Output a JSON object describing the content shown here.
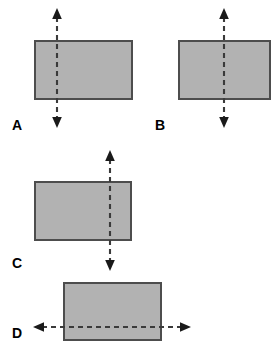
{
  "figure": {
    "kind": "physics-diagram",
    "background_color": "#ffffff",
    "block_fill_color": "#b2b2b2",
    "block_border_color": "#4d4d4d",
    "axis_color": "#3a3a3a",
    "arrowhead_color": "#1a1a1a",
    "label_color": "#000000"
  },
  "panels": [
    {
      "id": "A",
      "label": "A",
      "label_x": 12,
      "label_y": 118,
      "rect": {
        "x": 34,
        "y": 40,
        "w": 99,
        "h": 60
      },
      "axis": {
        "orientation": "vertical",
        "position_px": 57,
        "position_fraction": 0.23,
        "from": 10,
        "to": 126,
        "arrowheads": "both",
        "style": "dashed"
      }
    },
    {
      "id": "B",
      "label": "B",
      "label_x": 155,
      "label_y": 118,
      "rect": {
        "x": 178,
        "y": 40,
        "w": 93,
        "h": 60
      },
      "axis": {
        "orientation": "vertical",
        "position_px": 224,
        "position_fraction": 0.49,
        "from": 10,
        "to": 126,
        "arrowheads": "both",
        "style": "dashed"
      }
    },
    {
      "id": "C",
      "label": "C",
      "label_x": 12,
      "label_y": 256,
      "rect": {
        "x": 34,
        "y": 181,
        "w": 98,
        "h": 60
      },
      "axis": {
        "orientation": "vertical",
        "position_px": 110,
        "position_fraction": 0.78,
        "from": 151,
        "to": 270,
        "arrowheads": "both",
        "style": "dashed"
      }
    },
    {
      "id": "D",
      "label": "D",
      "label_x": 12,
      "label_y": 326,
      "rect": {
        "x": 63,
        "y": 282,
        "w": 99,
        "h": 59
      },
      "axis": {
        "orientation": "horizontal",
        "position_px": 327,
        "position_fraction": 0.77,
        "from": 34,
        "to": 190,
        "arrowheads": "both",
        "style": "dashed"
      }
    }
  ]
}
